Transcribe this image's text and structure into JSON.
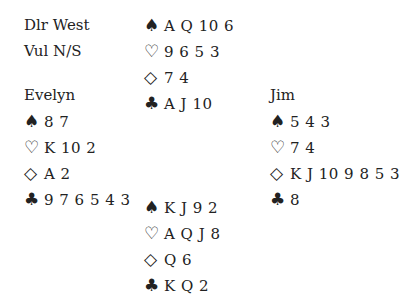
{
  "info": {
    "dealer": "Dlr West",
    "vul": "Vul N/S"
  },
  "suits": {
    "spades": "♠",
    "hearts": "♡",
    "diamonds": "◇",
    "clubs": "♣"
  },
  "north": {
    "name": "",
    "spades": "A Q 10 6",
    "hearts": "9 6 5 3",
    "diamonds": "7 4",
    "clubs": "A J 10"
  },
  "west": {
    "name": "Evelyn",
    "spades": "8 7",
    "hearts": "K 10 2",
    "diamonds": "A 2",
    "clubs": "9 7 6 5 4 3"
  },
  "east": {
    "name": "Jim",
    "spades": "5 4 3",
    "hearts": "7 4",
    "diamonds": "K J 10 9 8 5 3",
    "clubs": "8"
  },
  "south": {
    "name": "",
    "spades": "K J 9 2",
    "hearts": "A Q J 8",
    "diamonds": "Q 6",
    "clubs": "K Q 2"
  }
}
